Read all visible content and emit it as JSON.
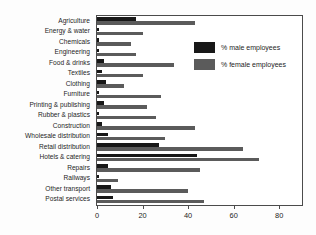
{
  "chart_data": {
    "type": "bar",
    "orientation": "horizontal",
    "title": "",
    "xlabel": "",
    "ylabel": "",
    "xlim": [
      0,
      90
    ],
    "xticks": [
      0,
      20,
      40,
      60,
      80
    ],
    "xticklabels": [
      "0",
      "20",
      "40",
      "60",
      "80"
    ],
    "grid": false,
    "legend_position": "upper right",
    "categories": [
      "Agriculture",
      "Energy & water",
      "Chemicals",
      "Engineering",
      "Food & drinks",
      "Textiles",
      "Clothing",
      "Furniture",
      "Printing & publishing",
      "Rubber & plastics",
      "Construction",
      "Wholesale distribution",
      "Retail distribution",
      "Hotels & catering",
      "Repairs",
      "Railways",
      "Other transport",
      "Postal services"
    ],
    "series": [
      {
        "name": "% male employees",
        "color": "#181818",
        "values": [
          17,
          1,
          1,
          1,
          3,
          2,
          4,
          1,
          3,
          1,
          2,
          5,
          27,
          44,
          5,
          1,
          6,
          7
        ]
      },
      {
        "name": "% female employees",
        "color": "#5b5b5b",
        "values": [
          43,
          20,
          15,
          17,
          34,
          20,
          12,
          28,
          22,
          26,
          43,
          30,
          64,
          71,
          45,
          9,
          40,
          47
        ]
      }
    ]
  },
  "legend": {
    "items": [
      {
        "label": "% male employees",
        "color": "#181818"
      },
      {
        "label": "% female employees",
        "color": "#5b5b5b"
      }
    ]
  }
}
